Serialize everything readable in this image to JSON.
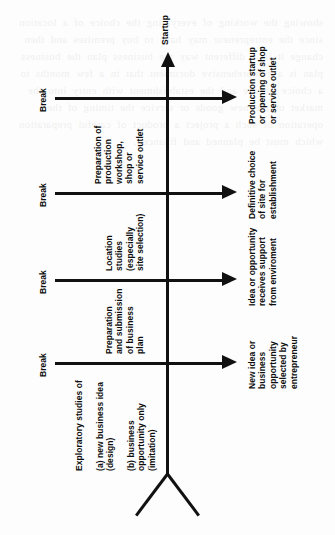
{
  "diagram": {
    "orientation": "rotated-90-ccw",
    "spine": {
      "terminal_label": "Startup",
      "arrow_direction": "up"
    },
    "break_label": "Break",
    "breaks": [
      {
        "id": "break-1",
        "label": "Break"
      },
      {
        "id": "break-2",
        "label": "Break"
      },
      {
        "id": "break-3",
        "label": "Break"
      },
      {
        "id": "break-4",
        "label": "Break"
      }
    ],
    "activities": [
      {
        "id": "activity-exploratory-studies",
        "lines": "Exploratory studies of\n\n(a) new business idea\n(design)\n\n(b) business\nopportunity only\n(imitation)",
        "text": "Exploratory studies of (a) new business idea (design) (b) business opportunity only (imitation)"
      },
      {
        "id": "activity-business-plan",
        "lines": "Preparation\nand submission\nof business\nplan",
        "text": "Preparation and submission of business plan"
      },
      {
        "id": "activity-location-studies",
        "lines": "Location\nstudies\n(especially\nsite selection)",
        "text": "Location studies (especially site selection)"
      },
      {
        "id": "activity-premises-preparation",
        "lines": "Preparation of\nproduction\nworkshop,\nshop or\nservice outlet",
        "text": "Preparation of production workshop, shop or service outlet"
      }
    ],
    "milestones": [
      {
        "id": "milestone-idea-selected",
        "lines": "New idea or\nbusiness\nopportunity\nselected by\nentrepreneur",
        "text": "New idea or business opportunity selected by entrepreneur"
      },
      {
        "id": "milestone-support-received",
        "lines": "Idea or opportunity\nreceives support\nfrom enviroment",
        "text": "Idea or opportunity receives support from enviroment"
      },
      {
        "id": "milestone-site-chosen",
        "lines": "Definitive choice\nof site for\nestablishment",
        "text": "Definitive choice of site for establishment"
      },
      {
        "id": "milestone-production-startup",
        "lines": "Production startup\nor opening of shop\nor service outlet",
        "text": "Production startup or opening of shop or service outlet"
      }
    ],
    "colors": {
      "ink": "#111111",
      "page": "#fdfdfd"
    }
  },
  "bleed": {
    "text": "showing the working of everything the choice of a location since the entrepreneur may have to buy premises and then change it in a different way the business plan the business plan is a comprehensive document that in a few months to a choice of site and the establishment with entry into the market of the new goods or service the timing of the operation of such a project a product of careful preparation which must be planned and financed."
  }
}
